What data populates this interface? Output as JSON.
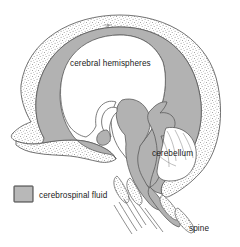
{
  "figure": {
    "name": "cross-section-of-head-showing-cerebrospinal-fluid",
    "background_color": "#ffffff"
  },
  "labels": {
    "cerebral_hemispheres": "cerebral hemispheres",
    "cerebellum": "cerebellum",
    "spine": "spine"
  },
  "legend": {
    "items": [
      {
        "label": "cerebrospinal fluid",
        "swatch_fill": "#b8b8b8",
        "swatch_stroke": "#3a3a3a"
      }
    ]
  },
  "colors": {
    "csf_gray": "#b2b2b2",
    "csf_gray_light": "#bdbdbd",
    "outline": "#4a4a4a",
    "outline_dark": "#3a3a3a",
    "skull_stipple_bg": "#ffffff",
    "stipple_dot": "#8a8a8a",
    "brain_white": "#ffffff",
    "text": "#1a1a1a"
  },
  "structures": [
    {
      "name": "skull-bone-stippled-band",
      "fill": "stipple",
      "description": "outer skull vault, stippled texture"
    },
    {
      "name": "cerebrospinal-fluid-layer",
      "fill": "#b2b2b2",
      "description": "gray band lining inside of skull"
    },
    {
      "name": "cerebral-hemispheres-region",
      "fill": "#ffffff",
      "description": "large white interior of cranial vault"
    },
    {
      "name": "cerebellum-region",
      "fill": "#ffffff",
      "description": "white lobed structure in posterior fossa"
    },
    {
      "name": "brainstem-and-ventricles",
      "fill": "#b2b2b2",
      "description": "central gray csf column"
    },
    {
      "name": "spinal-canal",
      "fill": "#b2b2b2",
      "description": "descending csf column into spine"
    }
  ]
}
